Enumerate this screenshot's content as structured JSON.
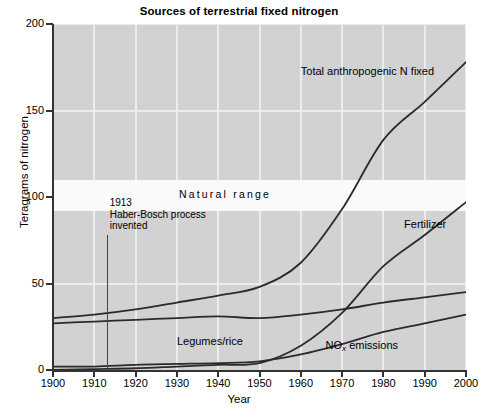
{
  "chart_data": {
    "type": "line",
    "title": "Sources of terrestrial fixed nitrogen",
    "xlabel": "Year",
    "ylabel": "Teragrams of nitrogen",
    "xlim": [
      1900,
      2000
    ],
    "ylim": [
      0,
      200
    ],
    "grid": true,
    "legend_position": "inline-labels",
    "xticks": [
      "1900",
      "1910",
      "1920",
      "1930",
      "1940",
      "1950",
      "1960",
      "1970",
      "1980",
      "1990",
      "2000"
    ],
    "yticks": [
      "0",
      "50",
      "100",
      "150",
      "200"
    ],
    "x": [
      1900,
      1910,
      1920,
      1930,
      1940,
      1950,
      1960,
      1970,
      1980,
      1990,
      2000
    ],
    "series": [
      {
        "name": "Total anthropogenic N fixed",
        "label": "Total anthropogenic N fixed",
        "color": "#2b2b2b",
        "values": [
          30,
          32,
          35,
          39,
          43,
          48,
          62,
          93,
          133,
          155,
          178
        ]
      },
      {
        "name": "Fertilizer",
        "label": "Fertilizer",
        "color": "#2b2b2b",
        "values": [
          0,
          0.5,
          1,
          2,
          3,
          4,
          14,
          33,
          60,
          78,
          97
        ]
      },
      {
        "name": "Legumes/rice",
        "label": "Legumes/rice",
        "color": "#2b2b2b",
        "values": [
          27,
          28,
          29,
          30,
          31,
          30,
          32,
          35,
          39,
          42,
          45
        ]
      },
      {
        "name": "NOx emissions",
        "label_prefix": "NO",
        "label_sub": "x",
        "label_suffix": " emissions",
        "color": "#2b2b2b",
        "values": [
          2,
          2,
          3,
          3.5,
          4,
          5,
          9,
          15,
          22,
          27,
          32
        ]
      }
    ],
    "bands": [
      {
        "name": "natural-range",
        "label": "Natural range",
        "y_min": 92,
        "y_max": 110,
        "color": "#fafafa"
      }
    ],
    "annotations": [
      {
        "name": "haber-bosch",
        "year": 1913,
        "line1": "1913",
        "line2": "Haber-Bosch process",
        "line3": "invented"
      }
    ],
    "background_color": "#d2d2d2",
    "gridline_color": "#ececec"
  }
}
